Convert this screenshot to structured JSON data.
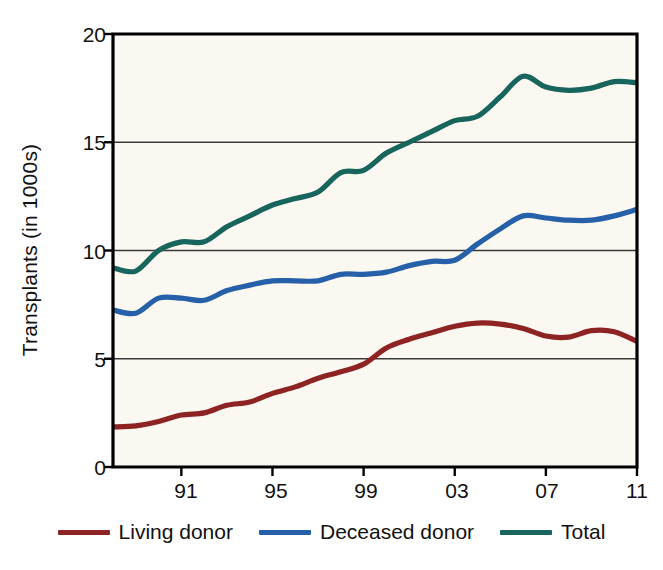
{
  "chart_data": {
    "type": "line",
    "title": "",
    "xlabel": "",
    "ylabel": "Transplants (in 1000s)",
    "ylim": [
      0,
      20
    ],
    "yticks": [
      0,
      5,
      10,
      15,
      20
    ],
    "ytick_labels": [
      "0",
      "5",
      "10",
      "15",
      "20"
    ],
    "xlim": [
      1988,
      2011
    ],
    "xticks": [
      1991,
      1995,
      1999,
      2003,
      2007,
      2011
    ],
    "xtick_labels": [
      "91",
      "95",
      "99",
      "03",
      "07",
      "11"
    ],
    "grid": "horizontal",
    "legend_position": "bottom",
    "x": [
      1988,
      1989,
      1990,
      1991,
      1992,
      1993,
      1994,
      1995,
      1996,
      1997,
      1998,
      1999,
      2000,
      2001,
      2002,
      2003,
      2004,
      2005,
      2006,
      2007,
      2008,
      2009,
      2010,
      2011
    ],
    "series": [
      {
        "name": "Living donor",
        "color": "#8E2323",
        "values": [
          1.85,
          1.9,
          2.1,
          2.4,
          2.5,
          2.85,
          3.0,
          3.4,
          3.7,
          4.1,
          4.4,
          4.75,
          5.5,
          5.9,
          6.2,
          6.5,
          6.65,
          6.6,
          6.4,
          6.05,
          6.0,
          6.3,
          6.25,
          5.8
        ]
      },
      {
        "name": "Deceased donor",
        "color": "#2560A8",
        "values": [
          7.25,
          7.1,
          7.8,
          7.8,
          7.7,
          8.15,
          8.4,
          8.6,
          8.6,
          8.6,
          8.9,
          8.9,
          9.0,
          9.3,
          9.5,
          9.55,
          10.3,
          11.0,
          11.6,
          11.5,
          11.4,
          11.4,
          11.6,
          11.9
        ]
      },
      {
        "name": "Total",
        "color": "#17655C",
        "values": [
          9.2,
          9.05,
          10.0,
          10.4,
          10.4,
          11.1,
          11.6,
          12.1,
          12.4,
          12.7,
          13.6,
          13.7,
          14.5,
          15.0,
          15.5,
          16.0,
          16.2,
          17.1,
          18.05,
          17.55,
          17.4,
          17.5,
          17.8,
          17.75
        ]
      }
    ]
  },
  "legend": {
    "items": [
      {
        "label": "Living donor"
      },
      {
        "label": "Deceased donor"
      },
      {
        "label": "Total"
      }
    ]
  },
  "colors": {
    "plot_background": "#FAF8F0",
    "axis": "#000000",
    "gridline": "#3A3A3A",
    "text": "#111111"
  }
}
